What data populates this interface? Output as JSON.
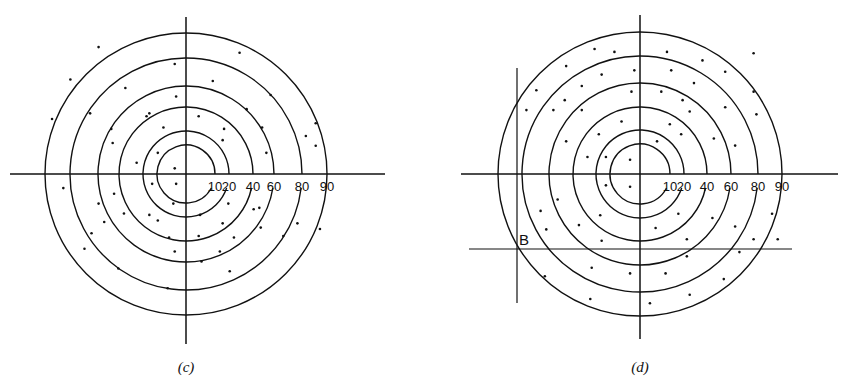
{
  "figure": {
    "panels": [
      {
        "id": "c",
        "caption": "(c)",
        "ring_labels": [
          "10",
          "20",
          "40",
          "60",
          "80",
          "90"
        ],
        "ring_values": [
          10,
          20,
          40,
          60,
          80,
          90
        ],
        "dots": [
          [
            0.38,
            -0.86
          ],
          [
            -0.62,
            -0.9
          ],
          [
            -0.08,
            -0.78
          ],
          [
            0.19,
            -0.66
          ],
          [
            -0.82,
            -0.67
          ],
          [
            -0.43,
            -0.61
          ],
          [
            0.6,
            -0.56
          ],
          [
            -0.68,
            -0.43
          ],
          [
            -0.26,
            -0.43
          ],
          [
            -0.07,
            -0.55
          ],
          [
            0.43,
            -0.46
          ],
          [
            -0.95,
            -0.39
          ],
          [
            -0.53,
            -0.32
          ],
          [
            -0.28,
            -0.41
          ],
          [
            0.09,
            -0.41
          ],
          [
            0.54,
            -0.33
          ],
          [
            0.57,
            -0.15
          ],
          [
            -0.16,
            -0.33
          ],
          [
            0.27,
            -0.32
          ],
          [
            -0.52,
            -0.22
          ],
          [
            -0.2,
            -0.15
          ],
          [
            0.26,
            -0.24
          ],
          [
            0.92,
            -0.36
          ],
          [
            0.85,
            -0.27
          ],
          [
            -0.35,
            -0.08
          ],
          [
            -0.08,
            -0.04
          ],
          [
            0.92,
            -0.2
          ],
          [
            -0.87,
            0.1
          ],
          [
            -0.24,
            0.07
          ],
          [
            -0.07,
            0.07
          ],
          [
            -0.51,
            0.14
          ],
          [
            -0.62,
            0.21
          ],
          [
            0.3,
            0.21
          ],
          [
            0.52,
            0.24
          ],
          [
            -0.09,
            0.21
          ],
          [
            -0.26,
            0.29
          ],
          [
            -0.44,
            0.28
          ],
          [
            0.48,
            0.25
          ],
          [
            -0.58,
            0.34
          ],
          [
            0.1,
            0.29
          ],
          [
            0.26,
            0.35
          ],
          [
            -0.2,
            0.33
          ],
          [
            -0.67,
            0.42
          ],
          [
            0.79,
            0.35
          ],
          [
            0.53,
            0.38
          ],
          [
            0.95,
            0.39
          ],
          [
            -0.12,
            0.45
          ],
          [
            0.09,
            0.44
          ],
          [
            0.34,
            0.45
          ],
          [
            -0.72,
            0.53
          ],
          [
            -0.08,
            0.55
          ],
          [
            0.69,
            0.44
          ],
          [
            0.24,
            0.55
          ],
          [
            0.11,
            0.62
          ],
          [
            -0.48,
            0.67
          ],
          [
            0.31,
            0.69
          ],
          [
            -0.13,
            0.81
          ]
        ]
      },
      {
        "id": "d",
        "caption": "(d)",
        "ring_labels": [
          "10",
          "20",
          "40",
          "60",
          "80",
          "90"
        ],
        "ring_values": [
          10,
          20,
          40,
          60,
          80,
          90
        ],
        "point_label": "B",
        "dots": [
          [
            -0.32,
            -0.88
          ],
          [
            -0.18,
            -0.86
          ],
          [
            0.19,
            -0.86
          ],
          [
            0.8,
            -0.85
          ],
          [
            0.44,
            -0.8
          ],
          [
            -0.52,
            -0.76
          ],
          [
            -0.04,
            -0.73
          ],
          [
            0.22,
            -0.73
          ],
          [
            0.6,
            -0.72
          ],
          [
            -0.27,
            -0.7
          ],
          [
            -0.41,
            -0.62
          ],
          [
            0.38,
            -0.64
          ],
          [
            -0.73,
            -0.59
          ],
          [
            -0.06,
            -0.58
          ],
          [
            0.15,
            -0.58
          ],
          [
            0.8,
            -0.58
          ],
          [
            -0.53,
            -0.52
          ],
          [
            0.3,
            -0.52
          ],
          [
            -0.8,
            -0.45
          ],
          [
            -0.61,
            -0.45
          ],
          [
            -0.41,
            -0.45
          ],
          [
            0.6,
            -0.47
          ],
          [
            0.35,
            -0.44
          ],
          [
            0.82,
            -0.42
          ],
          [
            -0.13,
            -0.37
          ],
          [
            0.21,
            -0.35
          ],
          [
            -0.29,
            -0.28
          ],
          [
            0.29,
            -0.28
          ],
          [
            0.52,
            -0.25
          ],
          [
            0.12,
            -0.23
          ],
          [
            -0.52,
            -0.23
          ],
          [
            0.67,
            -0.2
          ],
          [
            -0.24,
            -0.12
          ],
          [
            -0.37,
            -0.12
          ],
          [
            -0.07,
            -0.1
          ],
          [
            -0.24,
            0.08
          ],
          [
            -0.07,
            0.09
          ],
          [
            -0.58,
            0.18
          ],
          [
            -0.7,
            0.26
          ],
          [
            0.93,
            0.28
          ],
          [
            -0.28,
            0.29
          ],
          [
            0.27,
            0.28
          ],
          [
            0.51,
            0.31
          ],
          [
            -0.43,
            0.36
          ],
          [
            0.11,
            0.38
          ],
          [
            -0.66,
            0.39
          ],
          [
            0.67,
            0.37
          ],
          [
            0.8,
            0.46
          ],
          [
            0.97,
            0.46
          ],
          [
            -0.27,
            0.47
          ],
          [
            0.33,
            0.46
          ],
          [
            0.7,
            0.55
          ],
          [
            0.33,
            0.58
          ],
          [
            -0.34,
            0.66
          ],
          [
            0.18,
            0.7
          ],
          [
            -0.67,
            0.72
          ],
          [
            -0.07,
            0.7
          ],
          [
            0.59,
            0.74
          ],
          [
            0.35,
            0.85
          ],
          [
            -0.35,
            0.88
          ],
          [
            0.07,
            0.91
          ]
        ]
      }
    ]
  }
}
